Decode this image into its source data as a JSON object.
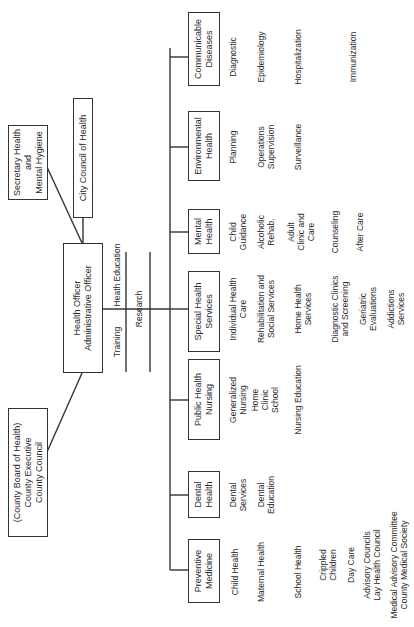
{
  "top_boxes": {
    "county": "(County Board of Health)\nCounty Executive\nCounty Council",
    "secretary": "Secretary Health\nand\nMental Hygiene",
    "city_council": "City Council of Health",
    "health_officer": "Health Officer\nAdministrative Officer"
  },
  "staff_functions": {
    "training": "Training",
    "health_education": "Heath Education",
    "research": "Research"
  },
  "divisions": [
    {
      "title": "Preventive\nMedicine",
      "items": [
        "Child Health",
        "Maternal Health",
        "School Health",
        "Crippled\nChildren",
        "Day Care",
        "Advisory Councils\nLay Health Council",
        "Medical Advisory Committee\nCounty Medical Society"
      ]
    },
    {
      "title": "Dental\nHealth",
      "items": [
        "Dental\nServices",
        "Dental\nEducation"
      ]
    },
    {
      "title": "Public Health\nNursing",
      "items": [
        "Generalized\nNursing",
        "Home\nClinic\nSchool",
        "Nursing Education"
      ]
    },
    {
      "title": "Special Health\nServices",
      "items": [
        "Individual Health\nCare",
        "Rehabilitation and\nSocial Services",
        "Home Health\nServices",
        "Diagnostic Clinics\nand Screening",
        "Geriatric\nEvaluations",
        "Addictions\nServices"
      ]
    },
    {
      "title": "Mental\nHealth",
      "items": [
        "Child\nGuidance",
        "Alcoholic\nRehab.",
        "Adult\nClinic and\nCare",
        "Counseling",
        "After Care"
      ]
    },
    {
      "title": "Environmental\nHealth",
      "items": [
        "Planning",
        "Operations\nSupervision",
        "Surveillance"
      ]
    },
    {
      "title": "Communicable\nDiseases",
      "items": [
        "Diagnostic",
        "Epidemiology",
        "Hospitalization",
        "Immunization"
      ]
    }
  ]
}
